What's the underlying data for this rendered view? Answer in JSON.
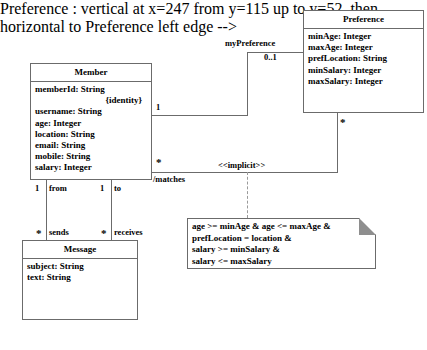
{
  "diagram": {
    "classes": [
      {
        "id": "member",
        "name": "Member",
        "attributes": [
          "memberId: String",
          "{identity}",
          "username: String",
          "age: Integer",
          "location: String",
          "email: String",
          "mobile: String",
          "salary: Integer"
        ]
      },
      {
        "id": "preference",
        "name": "Preference",
        "attributes": [
          "minAge: Integer",
          "maxAge: Integer",
          "prefLocation: String",
          "minSalary: Integer",
          "maxSalary: Integer"
        ]
      },
      {
        "id": "message",
        "name": "Message",
        "attributes": [
          "subject: String",
          "text: String"
        ]
      }
    ],
    "association_labels": {
      "my_preference": "myPreference",
      "my_preference_mult": "0..1",
      "member_to_preference_mult": "1",
      "matches_name": "/matches",
      "matches_member_mult": "*",
      "matches_preference_mult": "*",
      "implicit_stereotype": "<<implicit>>",
      "from_role": "from",
      "from_mult": "1",
      "to_role": "to",
      "to_mult": "1",
      "sends_role": "sends",
      "sends_mult": "*",
      "receives_role": "receives",
      "receives_mult": "*"
    },
    "note": {
      "lines": [
        "age >= minAge & age <= maxAge &",
        "prefLocation = location &",
        "salary >= minSalary &",
        "salary <= maxSalary"
      ]
    },
    "colors": {
      "stroke": "#6b6b6b",
      "text": "#000000",
      "background": "#ffffff",
      "note_fold": "#8e8e8e",
      "dashed": "#9a9a9a"
    }
  }
}
